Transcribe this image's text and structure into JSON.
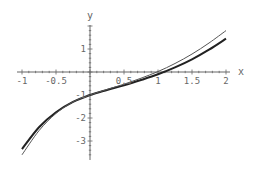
{
  "chart_data": {
    "type": "line",
    "title": "",
    "xlabel": "x",
    "ylabel": "y",
    "xlim": [
      -1,
      2
    ],
    "ylim": [
      -3.7,
      2.1
    ],
    "grid": false,
    "legend": "none",
    "x_ticks": [
      {
        "value": -1,
        "label": "-1"
      },
      {
        "value": -0.5,
        "label": "-0.5"
      },
      {
        "value": 0.5,
        "label": "0.5"
      },
      {
        "value": 1,
        "label": "1"
      },
      {
        "value": 1.5,
        "label": "1.5"
      },
      {
        "value": 2,
        "label": "2"
      }
    ],
    "y_ticks": [
      {
        "value": 1,
        "label": "1"
      },
      {
        "value": -1,
        "label": "-1"
      },
      {
        "value": -2,
        "label": "-2"
      },
      {
        "value": -3,
        "label": "-3"
      }
    ],
    "series": [
      {
        "name": "thick-curve",
        "color": "#222222",
        "width": 2,
        "x": [
          -1,
          -0.75,
          -0.5,
          -0.25,
          0,
          0.25,
          0.5,
          0.75,
          1,
          1.25,
          1.5,
          1.75,
          2
        ],
        "y": [
          -3.35,
          -2.4,
          -1.75,
          -1.3,
          -1.0,
          -0.78,
          -0.58,
          -0.35,
          -0.1,
          0.2,
          0.55,
          0.97,
          1.45
        ]
      },
      {
        "name": "thin-curve",
        "color": "#555555",
        "width": 1,
        "x": [
          -1,
          -0.75,
          -0.5,
          -0.25,
          0,
          0.25,
          0.5,
          0.75,
          1,
          1.25,
          1.5,
          1.75,
          2
        ],
        "y": [
          -3.6,
          -2.55,
          -1.8,
          -1.3,
          -1.0,
          -0.76,
          -0.53,
          -0.27,
          0.02,
          0.37,
          0.78,
          1.26,
          1.8
        ]
      }
    ]
  },
  "axes": {
    "x_label": "x",
    "y_label": "y"
  }
}
